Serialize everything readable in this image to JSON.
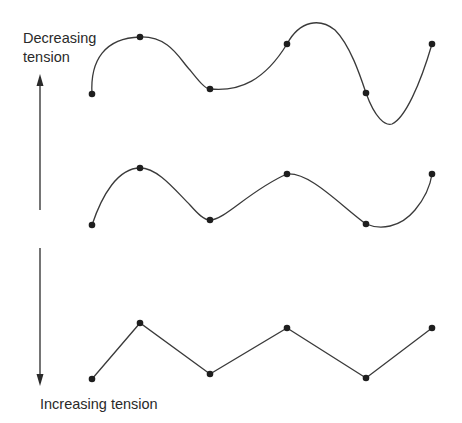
{
  "labels": {
    "top": "Decreasing tension",
    "top_line1": "Decreasing",
    "top_line2": "tension",
    "bottom": "Increasing tension"
  },
  "colors": {
    "stroke": "#3a3a3a",
    "points": "#1e1e1e",
    "text": "#2a2a2a",
    "background": "#ffffff"
  },
  "diagram": {
    "curves": [
      {
        "name": "low-tension-spline",
        "tension": "low",
        "points": [
          [
            92,
            94
          ],
          [
            140,
            37
          ],
          [
            210,
            89
          ],
          [
            287,
            44
          ],
          [
            366,
            93
          ],
          [
            432,
            44
          ]
        ]
      },
      {
        "name": "medium-tension-spline",
        "tension": "medium",
        "points": [
          [
            92,
            225
          ],
          [
            140,
            168
          ],
          [
            210,
            220
          ],
          [
            287,
            174
          ],
          [
            366,
            224
          ],
          [
            432,
            174
          ]
        ]
      },
      {
        "name": "high-tension-polyline",
        "tension": "high",
        "points": [
          [
            92,
            379
          ],
          [
            140,
            323
          ],
          [
            210,
            374
          ],
          [
            287,
            328
          ],
          [
            366,
            378
          ],
          [
            432,
            328
          ]
        ]
      }
    ],
    "arrows": [
      {
        "name": "up-arrow",
        "direction": "up",
        "meaning": "Decreasing tension"
      },
      {
        "name": "down-arrow",
        "direction": "down",
        "meaning": "Increasing tension"
      }
    ]
  }
}
